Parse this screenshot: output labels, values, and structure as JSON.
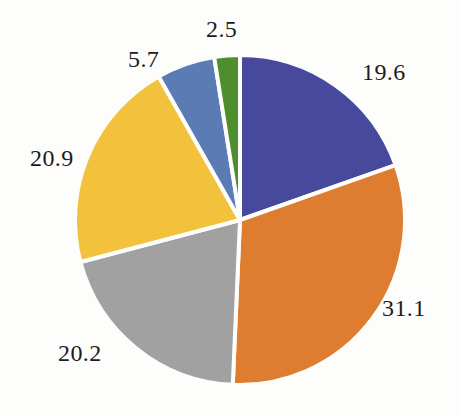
{
  "chart_data": {
    "type": "pie",
    "title": "",
    "subtitle": "",
    "xlabel": "",
    "ylabel": "",
    "grid": false,
    "legend": "none",
    "start_angle_deg": 0,
    "direction": "clockwise",
    "center": [
      240,
      220
    ],
    "radius": 165,
    "total": 100.0,
    "categories": [
      "19.6",
      "31.1",
      "20.2",
      "20.9",
      "5.7",
      "2.5"
    ],
    "values": [
      19.6,
      31.1,
      20.2,
      20.9,
      5.7,
      2.5
    ],
    "labels": [
      "19.6",
      "31.1",
      "20.2",
      "20.9",
      "5.7",
      "2.5"
    ],
    "colors": [
      "#474a9c",
      "#de7d2f",
      "#a1a1a1",
      "#f2c23d",
      "#5b7bb4",
      "#4e8e2c"
    ],
    "separator_color": "#fdfdfc",
    "label_color": "#1c1c1c",
    "slices": [
      {
        "label": "19.6",
        "value": 19.6,
        "color": "#474a9c",
        "start_deg": 0.0,
        "end_deg": 70.56
      },
      {
        "label": "31.1",
        "value": 31.1,
        "color": "#de7d2f",
        "start_deg": 70.56,
        "end_deg": 182.52
      },
      {
        "label": "20.2",
        "value": 20.2,
        "color": "#a1a1a1",
        "start_deg": 182.52,
        "end_deg": 255.24
      },
      {
        "label": "20.9",
        "value": 20.9,
        "color": "#f2c23d",
        "start_deg": 255.24,
        "end_deg": 330.48
      },
      {
        "label": "5.7",
        "value": 5.7,
        "color": "#5b7bb4",
        "start_deg": 330.48,
        "end_deg": 351.0
      },
      {
        "label": "2.5",
        "value": 2.5,
        "color": "#4e8e2c",
        "start_deg": 351.0,
        "end_deg": 360.0
      }
    ]
  },
  "figure": {
    "background": "#fdfdfc"
  }
}
